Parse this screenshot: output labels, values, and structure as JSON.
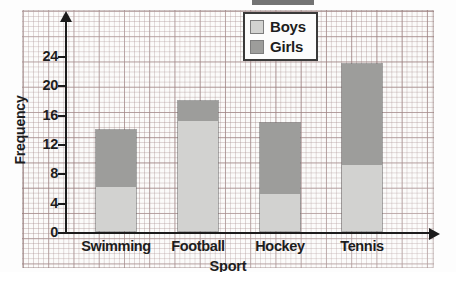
{
  "chart_data": {
    "type": "bar",
    "subtype": "stacked-vertical-bar",
    "title": "",
    "xlabel": "Sport",
    "ylabel": "Frequency",
    "categories": [
      "Swimming",
      "Football",
      "Hockey",
      "Tennis"
    ],
    "series": [
      {
        "name": "Boys",
        "color": "#d2d2d0",
        "values": [
          6,
          15,
          5,
          9
        ]
      },
      {
        "name": "Girls",
        "color": "#9d9d9b",
        "values": [
          8,
          3,
          10,
          14
        ]
      }
    ],
    "totals": [
      14,
      18,
      15,
      23
    ],
    "ylim": [
      0,
      26
    ],
    "ytick_labels": [
      "0",
      "4",
      "8",
      "12",
      "16",
      "20",
      "24"
    ],
    "ytick_values": [
      0,
      4,
      8,
      12,
      16,
      20,
      24
    ],
    "grid": true,
    "grid_style": "graph-paper",
    "legend_position": "top-right",
    "legend_entries": [
      "Boys",
      "Girls"
    ],
    "axis_arrows": true
  },
  "axes": {
    "y_title": "Frequency",
    "x_title": "Sport"
  },
  "legend": {
    "items": [
      {
        "label": "Boys",
        "swatch": "boys-swatch"
      },
      {
        "label": "Girls",
        "swatch": "girls-swatch"
      }
    ]
  },
  "colors": {
    "boys": "#d2d2d0",
    "girls": "#9d9d9b",
    "axis": "#1b1b1b",
    "grid_minor": "#96787833",
    "grid_major": "#825f5f9e",
    "paper": "#fbfbfa"
  }
}
